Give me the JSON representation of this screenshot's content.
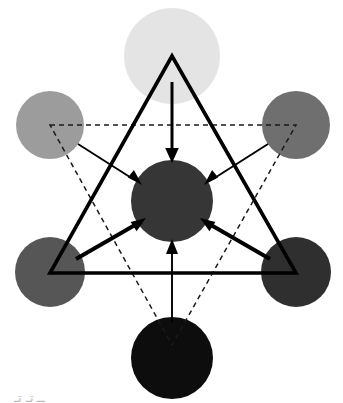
{
  "figure": {
    "type": "node-network-diagram",
    "background_color": "#ffffff",
    "width": 343,
    "height": 403,
    "caption_fragment": "ــ تـ تـ"
  },
  "palette": {
    "stroke_black": "#000000",
    "dashed_stroke": "#1a1a1a",
    "background": "#ffffff"
  },
  "nodes": [
    {
      "id": "top",
      "label": "top-node",
      "cx": 172,
      "cy": 56,
      "r": 48,
      "color": "#e4e4e4",
      "shade": "very-light-gray"
    },
    {
      "id": "upper-left",
      "label": "upper-left-node",
      "cx": 50,
      "cy": 125,
      "r": 34,
      "color": "#9c9c9c",
      "shade": "medium-gray"
    },
    {
      "id": "upper-right",
      "label": "upper-right-node",
      "cx": 296,
      "cy": 125,
      "r": 34,
      "color": "#6f6f6f",
      "shade": "dark-medium-gray"
    },
    {
      "id": "lower-left",
      "label": "lower-left-node",
      "cx": 50,
      "cy": 272,
      "r": 35,
      "color": "#565656",
      "shade": "dark-gray"
    },
    {
      "id": "lower-right",
      "label": "lower-right-node",
      "cx": 296,
      "cy": 272,
      "r": 35,
      "color": "#2f2f2f",
      "shade": "very-dark-gray"
    },
    {
      "id": "bottom",
      "label": "bottom-node",
      "cx": 172,
      "cy": 358,
      "r": 41,
      "color": "#0d0d0d",
      "shade": "near-black"
    },
    {
      "id": "center",
      "label": "center-node",
      "cx": 172,
      "cy": 201,
      "r": 41,
      "color": "#363636",
      "shade": "dark-gray"
    }
  ],
  "triangles": [
    {
      "id": "solid-triangle",
      "style": "solid",
      "stroke_width": 3.6,
      "orientation": "upward",
      "points": "172,56 296,273 50,273"
    },
    {
      "id": "dashed-triangle",
      "style": "dashed",
      "stroke_width": 1.5,
      "orientation": "downward",
      "points": "50,125 296,125 172,345"
    }
  ],
  "arrows": [
    {
      "id": "arrow-top-to-center",
      "from": "top",
      "to": "center",
      "weight": "medium",
      "stroke_width": 3.0,
      "head_size": 8,
      "x1": 172,
      "y1": 82,
      "x2": 172,
      "y2": 158
    },
    {
      "id": "arrow-upper-left-to-center",
      "from": "upper-left",
      "to": "center",
      "weight": "thin",
      "stroke_width": 1.9,
      "head_size": 7,
      "x1": 78,
      "y1": 144,
      "x2": 137,
      "y2": 182
    },
    {
      "id": "arrow-upper-right-to-center",
      "from": "upper-right",
      "to": "center",
      "weight": "thin",
      "stroke_width": 1.9,
      "head_size": 7,
      "x1": 268,
      "y1": 144,
      "x2": 208,
      "y2": 182
    },
    {
      "id": "arrow-lower-left-to-center",
      "from": "lower-left",
      "to": "center",
      "weight": "thick",
      "stroke_width": 4.0,
      "head_size": 9,
      "x1": 78,
      "y1": 258,
      "x2": 140,
      "y2": 221
    },
    {
      "id": "arrow-lower-right-to-center",
      "from": "lower-right",
      "to": "center",
      "weight": "thick",
      "stroke_width": 4.0,
      "head_size": 9,
      "x1": 268,
      "y1": 258,
      "x2": 207,
      "y2": 221
    },
    {
      "id": "arrow-bottom-to-center",
      "from": "bottom",
      "to": "center",
      "weight": "thin",
      "stroke_width": 1.9,
      "head_size": 7,
      "x1": 172,
      "y1": 322,
      "x2": 172,
      "y2": 245
    }
  ]
}
